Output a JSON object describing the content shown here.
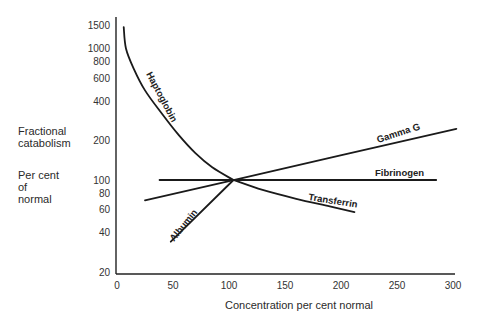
{
  "chart_data": {
    "type": "line",
    "title": "",
    "xlabel": "Concentration per cent normal",
    "ylabel": "Fractional catabolism — Per cent of normal",
    "ylabel_lines_top": [
      "Fractional",
      "catabolism"
    ],
    "ylabel_lines_bottom": [
      "Per cent",
      "of",
      "normal"
    ],
    "xscale": "linear",
    "yscale": "log",
    "xlim": [
      0,
      300
    ],
    "ylim": [
      20,
      1500
    ],
    "xticks": [
      0,
      50,
      100,
      150,
      200,
      250,
      300
    ],
    "yticks": [
      20,
      40,
      60,
      80,
      100,
      200,
      400,
      600,
      800,
      1000,
      1500
    ],
    "grid": false,
    "legend": "inline labels on curves",
    "series": [
      {
        "name": "Haptoglobin",
        "points": [
          [
            6,
            1450
          ],
          [
            8,
            1000
          ],
          [
            15,
            700
          ],
          [
            25,
            480
          ],
          [
            40,
            320
          ],
          [
            55,
            220
          ],
          [
            70,
            160
          ],
          [
            85,
            125
          ],
          [
            104,
            100
          ]
        ]
      },
      {
        "name": "Transferrin",
        "points": [
          [
            104,
            100
          ],
          [
            130,
            84
          ],
          [
            160,
            72
          ],
          [
            190,
            63
          ],
          [
            212,
            57
          ]
        ]
      },
      {
        "name": "Albumin",
        "points": [
          [
            48,
            34
          ],
          [
            104,
            100
          ]
        ]
      },
      {
        "name": "Gamma G",
        "points": [
          [
            25,
            70
          ],
          [
            104,
            100
          ],
          [
            303,
            245
          ]
        ]
      },
      {
        "name": "Fibrinogen",
        "points": [
          [
            38,
            100
          ],
          [
            104,
            100
          ],
          [
            285,
            100
          ]
        ]
      }
    ]
  }
}
